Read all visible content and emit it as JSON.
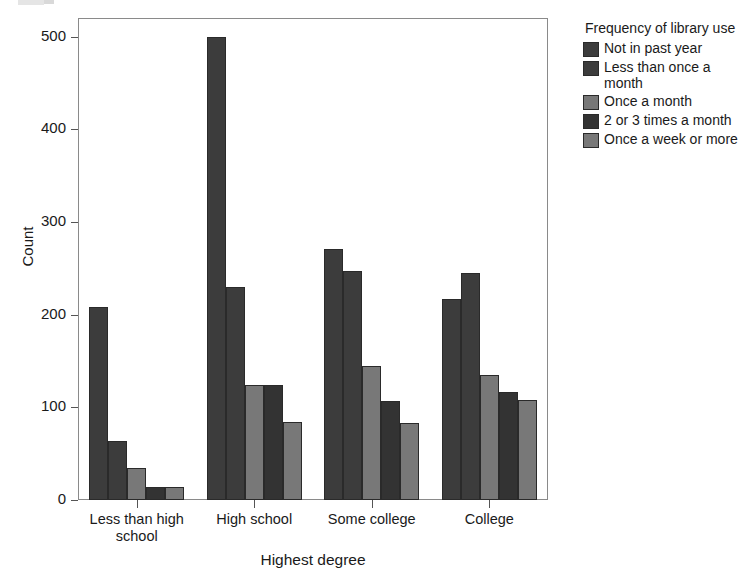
{
  "chart_data": {
    "type": "bar",
    "title": "",
    "xlabel": "Highest degree",
    "ylabel": "Count",
    "categories": [
      "Less than high school",
      "High school",
      "Some college",
      "College"
    ],
    "legend_title": "Frequency of library use",
    "legend_position": "right",
    "grid": false,
    "ylim": [
      0,
      520
    ],
    "yticks": [
      0,
      100,
      200,
      300,
      400,
      500
    ],
    "ytick_labels": [
      "0",
      "100",
      "200",
      "300",
      "400",
      "500"
    ],
    "series": [
      {
        "name": "Not in past year",
        "color": "#3c3c3c",
        "values": [
          208,
          500,
          271,
          217
        ]
      },
      {
        "name": "Less than once a month",
        "color": "#3c3c3c",
        "values": [
          64,
          230,
          247,
          245
        ]
      },
      {
        "name": "Once a month",
        "color": "#787878",
        "values": [
          35,
          124,
          145,
          135
        ]
      },
      {
        "name": "2 or 3 times a month",
        "color": "#333333",
        "values": [
          14,
          124,
          107,
          117
        ]
      },
      {
        "name": "Once a week or more",
        "color": "#787878",
        "values": [
          14,
          84,
          83,
          108
        ]
      }
    ]
  },
  "axis": {
    "y_title": "Count",
    "x_title": "Highest degree",
    "y_tick_labels": [
      "500",
      "400",
      "300",
      "200",
      "100",
      "0"
    ],
    "x_tick_labels": [
      "Less than high school",
      "High school",
      "Some college",
      "College"
    ]
  },
  "legend": {
    "title": "Frequency of library use",
    "items": [
      {
        "label": "Not in past year"
      },
      {
        "label": "Less than once a month"
      },
      {
        "label": "Once a month"
      },
      {
        "label": "2 or 3 times a month"
      },
      {
        "label": "Once a week or more"
      }
    ]
  }
}
